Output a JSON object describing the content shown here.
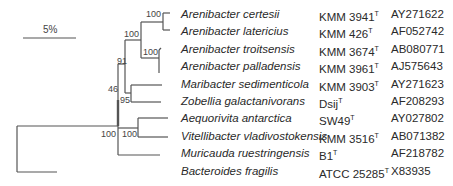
{
  "scale_bar": {
    "label": "5%"
  },
  "taxa": [
    {
      "species": "Arenibacter certesii",
      "strain": "KMM 3941",
      "type_mark": "T",
      "accession": "AY271622"
    },
    {
      "species": "Arenibacter latericius",
      "strain": "KMM 426",
      "type_mark": "T",
      "accession": "AF052742"
    },
    {
      "species": "Arenibacter troitsensis",
      "strain": "KMM 3674",
      "type_mark": "T",
      "accession": "AB080771"
    },
    {
      "species": "Arenibacter palladensis",
      "strain": "KMM 3961",
      "type_mark": "T",
      "accession": "AJ575643"
    },
    {
      "species": "Maribacter sedimenticola",
      "strain": "KMM 3903",
      "type_mark": "T",
      "accession": "AY271623"
    },
    {
      "species": "Zobellia galactanivorans",
      "strain": "Dsij",
      "type_mark": "T",
      "accession": "AF208293"
    },
    {
      "species": "Aequorivita antarctica",
      "strain": "SW49",
      "type_mark": "T",
      "accession": "AY027802"
    },
    {
      "species": "Vitellibacter vladivostokensis",
      "strain": "KMM 3516",
      "type_mark": "T",
      "accession": "AB071382"
    },
    {
      "species": "Muricauda ruestringensis",
      "strain": "B1",
      "type_mark": "T",
      "accession": "AF218782"
    },
    {
      "species": "Bacteroides fragilis",
      "strain": "ATCC 25285",
      "type_mark": "T",
      "accession": "X83935"
    }
  ],
  "bootstrap": {
    "certesii_latericius": "100",
    "arenibacter_clade": "100",
    "troitsensis_palladensis": "100",
    "arenibacter_maribacter_zobellia": "91",
    "maribacter_zobellia": "95",
    "inner_node": "46",
    "ingroup": "100",
    "aequorivita_vitellibacter": "100"
  }
}
